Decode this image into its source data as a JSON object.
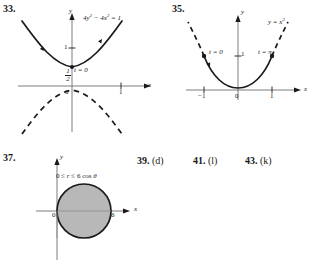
{
  "page": {
    "background": "#ffffff",
    "ink": "#1a1a1a",
    "shade": "#b8b8b8"
  },
  "problems": [
    {
      "number": "33.",
      "figure": {
        "type": "hyperbola-graph",
        "equation": "4y² − 4x² = 1",
        "axis_labels": {
          "x": "x",
          "y": "y"
        },
        "origin_label": "0",
        "y_ticks": [
          "1"
        ],
        "x_ticks": [
          "1"
        ],
        "vertex_label_numerator": "1",
        "vertex_label_denominator": "2",
        "parameter_label": "t = 0",
        "upper_branch_style": "solid-with-direction-arrows",
        "lower_branch_style": "dashed"
      }
    },
    {
      "number": "35.",
      "figure": {
        "type": "parabola-graph",
        "equation": "y = x²",
        "axis_labels": {
          "x": "x",
          "y": "y"
        },
        "origin_label": "0",
        "y_ticks": [
          "1"
        ],
        "x_ticks": [
          "−1",
          "1"
        ],
        "start_point_label": "t = 0",
        "end_point_label": "t = π",
        "traced_style": "solid-with-arrow",
        "outside_style": "dashed"
      }
    },
    {
      "number": "37.",
      "figure": {
        "type": "polar-region-graph",
        "inequality": "0 ≤ r ≤ 6 cos θ",
        "axis_labels": {
          "x": "x",
          "y": "y"
        },
        "origin_label": "0",
        "x_ticks": [
          "6"
        ],
        "region_fill": "#b8b8b8"
      }
    }
  ],
  "short_answers": [
    {
      "number": "39.",
      "answer": "(d)"
    },
    {
      "number": "41.",
      "answer": "(l)"
    },
    {
      "number": "43.",
      "answer": "(k)"
    }
  ]
}
